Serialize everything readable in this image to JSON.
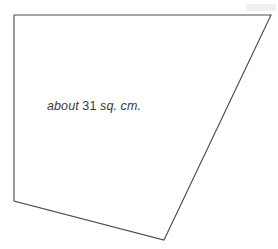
{
  "figure": {
    "name": "quadrilateral-area-figure",
    "background_color": "#ffffff",
    "stroke_color": "#4a4a4a",
    "stroke_width": 1.1,
    "fill_color": "none",
    "width": 278,
    "height": 249,
    "shape_type": "quadrilateral",
    "vertices": [
      {
        "name": "top-left",
        "x": 14,
        "y": 15
      },
      {
        "name": "top-right",
        "x": 271,
        "y": 15
      },
      {
        "name": "bottom-apex",
        "x": 164,
        "y": 240
      },
      {
        "name": "bottom-left",
        "x": 14,
        "y": 201
      }
    ],
    "points_attr": "14,15 271,15 164,240 14,201",
    "edges": [
      {
        "name": "top-edge",
        "from": "top-left",
        "to": "top-right"
      },
      {
        "name": "right-edge",
        "from": "top-right",
        "to": "bottom-apex"
      },
      {
        "name": "bottom-edge",
        "from": "bottom-apex",
        "to": "bottom-left"
      },
      {
        "name": "left-edge",
        "from": "bottom-left",
        "to": "top-left"
      }
    ],
    "artifact": {
      "name": "scan-smudge",
      "x": 246,
      "y": 4,
      "width": 30,
      "height": 7,
      "color": "#efefef"
    }
  },
  "label": {
    "full_text": "about 31 sq. cm.",
    "lead_word": "about",
    "value": "31",
    "units": "sq. cm.",
    "color": "#3a3a3a"
  }
}
